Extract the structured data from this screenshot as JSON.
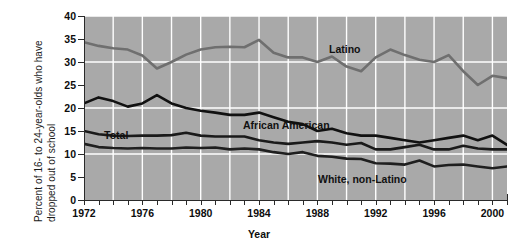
{
  "chart_data": {
    "type": "line",
    "title": "",
    "xlabel": "Year",
    "ylabel": "Percent of 16- to 24-year-olds who have dropped out of school",
    "xlim": [
      1972,
      2001
    ],
    "ylim": [
      0,
      40
    ],
    "ytick_values": [
      0,
      5,
      10,
      15,
      20,
      25,
      30,
      35,
      40
    ],
    "ytick_labels": [
      "0",
      "5",
      "10",
      "15",
      "20",
      "25",
      "30",
      "35",
      "40"
    ],
    "xtick_values": [
      1972,
      1976,
      1980,
      1984,
      1988,
      1992,
      1996,
      2000
    ],
    "xtick_labels": [
      "1972",
      "1976",
      "1980",
      "1984",
      "1988",
      "1992",
      "1996",
      "2000"
    ],
    "minor_xticks_every": 1,
    "grid": "white gridlines, horizontal every 10 units, vertical every 2 years",
    "plot_background": "#a9a9a9",
    "legend_position": "inline labels on plot",
    "x": [
      1972,
      1973,
      1974,
      1975,
      1976,
      1977,
      1978,
      1979,
      1980,
      1981,
      1982,
      1983,
      1984,
      1985,
      1986,
      1987,
      1988,
      1989,
      1990,
      1991,
      1992,
      1993,
      1994,
      1995,
      1996,
      1997,
      1998,
      1999,
      2000,
      2001
    ],
    "series": [
      {
        "name": "Latino",
        "color": "#6f6f6f",
        "values": [
          34.3,
          33.5,
          33.0,
          32.7,
          31.4,
          28.6,
          30.0,
          31.6,
          32.7,
          33.2,
          33.3,
          33.2,
          34.8,
          32.0,
          31.0,
          31.0,
          30.0,
          31.2,
          29.0,
          28.0,
          31.0,
          32.7,
          31.5,
          30.5,
          30.0,
          31.5,
          28.0,
          25.0,
          27.0,
          26.5
        ]
      },
      {
        "name": "African American",
        "color": "#111111",
        "values": [
          21.0,
          22.3,
          21.5,
          20.3,
          21.0,
          22.8,
          21.0,
          20.0,
          19.4,
          19.0,
          18.5,
          18.5,
          19.0,
          18.0,
          17.0,
          16.5,
          15.0,
          15.5,
          14.5,
          14.0,
          14.0,
          13.5,
          13.0,
          12.5,
          13.0,
          13.5,
          14.0,
          13.0,
          14.0,
          12.0
        ]
      },
      {
        "name": "Total",
        "color": "#1a1a1a",
        "values": [
          15.0,
          14.3,
          14.0,
          13.9,
          14.0,
          14.0,
          14.1,
          14.6,
          14.0,
          13.8,
          13.8,
          13.8,
          13.0,
          12.5,
          12.2,
          12.5,
          12.8,
          12.5,
          12.0,
          12.4,
          11.0,
          11.0,
          11.5,
          12.0,
          11.0,
          11.0,
          11.8,
          11.2,
          11.0,
          11.0
        ]
      },
      {
        "name": "White, non-Latino",
        "color": "#1f1f1f",
        "values": [
          12.2,
          11.5,
          11.3,
          11.2,
          11.3,
          11.2,
          11.2,
          11.4,
          11.3,
          11.4,
          11.0,
          11.2,
          11.0,
          10.4,
          10.0,
          10.4,
          9.6,
          9.4,
          9.0,
          8.9,
          8.0,
          7.9,
          7.7,
          8.6,
          7.3,
          7.6,
          7.7,
          7.3,
          6.9,
          7.3
        ]
      }
    ],
    "series_label_text": {
      "latino": "Latino",
      "african_american": "African American",
      "total": "Total",
      "white_non_latino": "White, non-Latino"
    }
  },
  "axis": {
    "x_title": "Year"
  }
}
